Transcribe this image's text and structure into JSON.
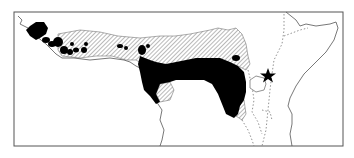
{
  "map": {
    "type": "species-range-map",
    "region": "Tropical Africa (West to East Africa)",
    "width": 354,
    "height": 158,
    "frame": {
      "x": 14,
      "y": 12,
      "width": 329,
      "height": 134
    },
    "legend_text": [],
    "labels": [],
    "colors": {
      "background": "#ffffff",
      "frame": "#555555",
      "coastline": "#555555",
      "solid_range": "#000000",
      "hatched_range": "#bdbdbd",
      "border_dotted": "#777777",
      "star_marker": "#000000"
    },
    "features": {
      "solid_range": "Dense/confirmed range (solid black) across West African coast, Central African forest block",
      "hatched_range": "Peripheral/savanna range (diagonal hatching) across Sahel belt north of forest",
      "dotted_borders": "Dashed national/rift borders in East Africa",
      "lake": "Lake outline (Lake Victoria) near star",
      "star_marker": "Star symbol marking a locality east of Lake Victoria"
    }
  }
}
